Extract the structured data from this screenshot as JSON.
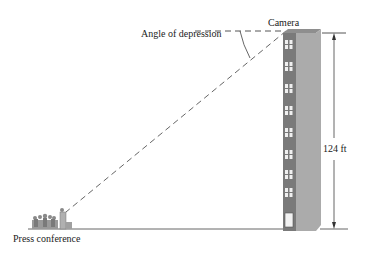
{
  "labels": {
    "camera": "Camera",
    "angle": "Angle of depression",
    "height": "124 ft",
    "press": "Press conference"
  },
  "colors": {
    "line": "#555555",
    "building_front": "#7a7a7a",
    "building_side": "#a9a9a9",
    "building_top": "#8e8e8e",
    "window": "#f2f2f2"
  },
  "measurements": {
    "building_height_ft": 124
  }
}
